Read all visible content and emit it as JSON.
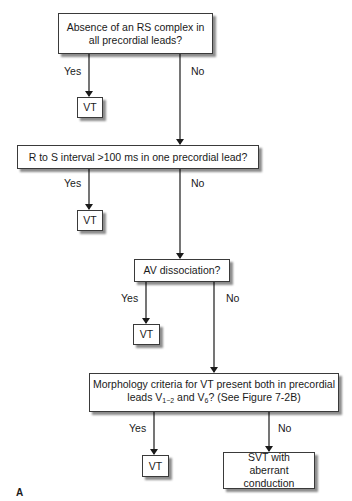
{
  "diagram": {
    "nodes": {
      "q1": {
        "text": "Absence of an RS complex in all precordial leads?"
      },
      "vt1": {
        "text": "VT"
      },
      "q2": {
        "text": "R to S interval >100 ms in one precordial lead?"
      },
      "vt2": {
        "text": "VT"
      },
      "q3": {
        "text": "AV dissociation?"
      },
      "vt3": {
        "text": "VT"
      },
      "q4": {
        "line1": "Morphology criteria for VT present both in precordial",
        "line2_pre": "leads V",
        "line2_sub1": "1−2",
        "line2_mid": " and V",
        "line2_sub2": "6",
        "line2_post": "? (See Figure 7-2B)"
      },
      "vt4": {
        "text": "VT"
      },
      "svt": {
        "text": "SVT with aberrant conduction"
      }
    },
    "edges": [
      {
        "from": "q1",
        "to": "vt1",
        "label": "Yes"
      },
      {
        "from": "q1",
        "to": "q2",
        "label": "No"
      },
      {
        "from": "q2",
        "to": "vt2",
        "label": "Yes"
      },
      {
        "from": "q2",
        "to": "q3",
        "label": "No"
      },
      {
        "from": "q3",
        "to": "vt3",
        "label": "Yes"
      },
      {
        "from": "q3",
        "to": "q4",
        "label": "No"
      },
      {
        "from": "q4",
        "to": "vt4",
        "label": "Yes"
      },
      {
        "from": "q4",
        "to": "svt",
        "label": "No"
      }
    ],
    "panel_label": "A"
  }
}
